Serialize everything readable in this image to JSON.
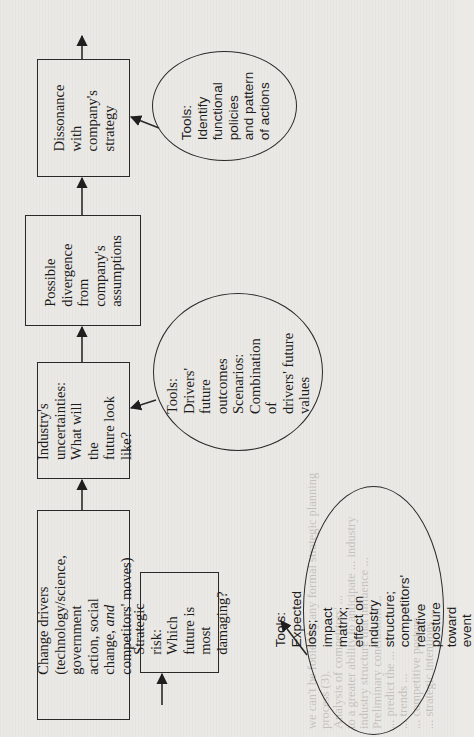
{
  "diagram": {
    "orientation": "rotated 90deg counter-clockwise",
    "flow_boxes": [
      {
        "id": "change_drivers",
        "lines": [
          "Change drivers",
          "(technology/science, government",
          "action, social change, and",
          "competitors' moves)"
        ],
        "italic_word": "and"
      },
      {
        "id": "industry_uncertainties",
        "lines": [
          "Industry's",
          "uncertainties:",
          "What will the",
          "future look like?"
        ]
      },
      {
        "id": "possible_divergence",
        "lines": [
          "Possible",
          "divergence",
          "from",
          "company's",
          "assumptions"
        ]
      },
      {
        "id": "dissonance",
        "lines": [
          "Dissonance with",
          "company's",
          "strategy"
        ]
      }
    ],
    "side_box": {
      "id": "strategic_risk",
      "lines": [
        "Strategic",
        "risk: Which",
        "future is",
        "most",
        "damaging?"
      ]
    },
    "tool_ellipses": [
      {
        "id": "tools_dissonance",
        "target": "dissonance",
        "lines": [
          "Tools:",
          "Identify",
          "functional",
          "policies",
          "and pattern",
          "of actions"
        ]
      },
      {
        "id": "tools_uncertainties",
        "target": "industry_uncertainties",
        "lines": [
          "Tools: Drivers'",
          "future",
          "outcomes",
          "Scenarios:",
          "Combination of",
          "drivers' future",
          "values"
        ]
      },
      {
        "id": "tools_strategic_risk",
        "target": "strategic_risk",
        "lines": [
          "Tools: Expected loss;",
          "impact matrix;",
          "effect on industry",
          "structure;",
          "competitors' relative",
          "posture toward event"
        ]
      }
    ],
    "connections": [
      {
        "from": "change_drivers",
        "to": "industry_uncertainties"
      },
      {
        "from": "industry_uncertainties",
        "to": "possible_divergence"
      },
      {
        "from": "possible_divergence",
        "to": "dissonance"
      },
      {
        "from": "dissonance",
        "to": "output"
      },
      {
        "from": "input",
        "to": "strategic_risk"
      },
      {
        "from": "tools_dissonance",
        "to": "dissonance"
      },
      {
        "from": "tools_uncertainties",
        "to": "industry_uncertainties"
      },
      {
        "from": "tools_strategic_risk",
        "to": "strategic_risk"
      }
    ]
  },
  "text": {
    "change_drivers": "Change drivers\n(technology/science, government\naction, social change, ",
    "change_drivers_italic": "and",
    "change_drivers_tail": "\ncompetitors' moves)",
    "industry_uncertainties": "Industry's\nuncertainties:\nWhat will the\nfuture look like?",
    "possible_divergence": "Possible\ndivergence\nfrom\ncompany's\nassumptions",
    "dissonance": "Dissonance with\ncompany's\nstrategy",
    "strategic_risk": "Strategic\nrisk: Which\nfuture is\nmost\ndamaging?",
    "tools_dissonance": "Tools:\nIdentify\nfunctional\npolicies\nand pattern\nof actions",
    "tools_uncertainties": "Tools: Drivers'\nfuture\noutcomes\nScenarios:\nCombination of\ndrivers' future\nvalues",
    "tools_strategic_risk": "Tools: Expected loss;\nimpact matrix;\neffect on industry\nstructure;\ncompetitors' relative\nposture toward event"
  },
  "bleed_through": {
    "lines": [
      "we can't be fooled by any formal strategic planning",
      "process (3).",
      "   Analysis of competitors' ... ",
      "   to a greater ability to anticipate ... industry",
      "   industry structure that influence ...",
      "   Preliminary conclusions ...",
      "   ... predict the ...",
      "   ... trends ...",
      "   ... competitive posture ...",
      "   ... strategic intentions ...",
      "",
      "Summary: Identifying the Highest Risks",
      "",
      "   ... company ... possible ... order the greatest ...",
      "   ... industry ... scenarios ..."
    ],
    "heading": "Summary: Identifying the Highest Risks"
  }
}
